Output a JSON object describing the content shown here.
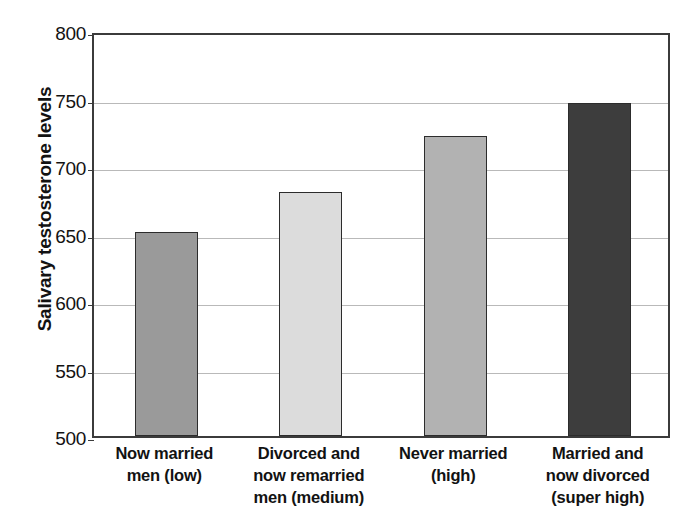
{
  "chart_data": {
    "type": "bar",
    "title": "",
    "xlabel": "",
    "ylabel": "Salivary testosterone levels",
    "ylim": [
      500,
      800
    ],
    "ytick_step": 50,
    "yticks": [
      800,
      750,
      700,
      650,
      600,
      550,
      500
    ],
    "grid": true,
    "legend": "none",
    "categories": [
      "Now married men (low)",
      "Divorced and now remarried men (medium)",
      "Never married (high)",
      "Married and now divorced (super high)"
    ],
    "category_lines": [
      [
        "Now married",
        "men (low)"
      ],
      [
        "Divorced and",
        "now remarried",
        "men (medium)"
      ],
      [
        "Never married",
        "(high)"
      ],
      [
        "Married and",
        "now divorced",
        "(super high)"
      ]
    ],
    "values": [
      651,
      681,
      722,
      747
    ],
    "bar_colors": [
      "#9a9a9a",
      "#dcdcdc",
      "#b2b2b2",
      "#3d3d3d"
    ],
    "bar_edge_color": "#2c2c2c",
    "axis_color": "#3b3b3b",
    "gridline_color": "#b9b9b9",
    "background_color": "#ffffff"
  }
}
